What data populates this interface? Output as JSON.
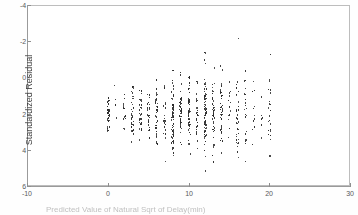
{
  "figure": {
    "background_color": "#ffffff",
    "frame_color": "#bdbdbd",
    "point_color": "#2b2b2b"
  },
  "axes": {
    "y_title": "Standardized Residual",
    "x_title": "Predicted Value of Natural Sqrt of Delay(min)",
    "y_ticks": [
      "6",
      "4",
      "2",
      "0",
      "-2",
      "-4"
    ],
    "x_ticks": [
      "-10",
      "0",
      "10",
      "20",
      "30"
    ]
  },
  "chart_data": {
    "type": "scatter",
    "title": "",
    "xlabel": "Predicted Value of Natural Sqrt of Delay(min)",
    "ylabel": "Standardized Residual",
    "xlim": [
      -10,
      30
    ],
    "ylim": [
      -4,
      6
    ],
    "xticks": [
      -10,
      0,
      10,
      20,
      30
    ],
    "yticks": [
      -4,
      -2,
      0,
      2,
      4,
      6
    ],
    "grid": false,
    "legend": null,
    "series": [
      {
        "name": "residuals",
        "description": "Standardized residuals plotted against predicted values; points fall in near-vertical stripes at roughly integer predicted values from 0 to 20, with spread widening as the predicted value increases.",
        "columns": [
          {
            "x": 0.0,
            "y_min": -0.9,
            "y_max": 0.9,
            "n": 42,
            "y_center": 0.0,
            "spread": 0.45
          },
          {
            "x": 0.9,
            "y_min": -0.2,
            "y_max": 1.6,
            "n": 4,
            "y_center": 0.7,
            "spread": 0.6
          },
          {
            "x": 2.0,
            "y_min": -0.8,
            "y_max": 1.1,
            "n": 14,
            "y_center": 0.1,
            "spread": 0.5
          },
          {
            "x": 3.0,
            "y_min": -1.5,
            "y_max": 1.5,
            "n": 36,
            "y_center": 0.0,
            "spread": 0.7
          },
          {
            "x": 4.0,
            "y_min": -1.4,
            "y_max": 1.3,
            "n": 34,
            "y_center": 0.0,
            "spread": 0.65
          },
          {
            "x": 5.0,
            "y_min": -1.3,
            "y_max": 1.1,
            "n": 26,
            "y_center": -0.05,
            "spread": 0.6
          },
          {
            "x": 6.0,
            "y_min": -1.6,
            "y_max": 1.9,
            "n": 40,
            "y_center": 0.05,
            "spread": 0.8
          },
          {
            "x": 7.0,
            "y_min": -2.6,
            "y_max": 1.6,
            "n": 24,
            "y_center": -0.1,
            "spread": 0.85
          },
          {
            "x": 8.0,
            "y_min": -2.3,
            "y_max": 2.4,
            "n": 70,
            "y_center": 0.0,
            "spread": 0.95
          },
          {
            "x": 9.0,
            "y_min": -1.7,
            "y_max": 2.3,
            "n": 44,
            "y_center": 0.05,
            "spread": 0.85
          },
          {
            "x": 10.0,
            "y_min": -2.2,
            "y_max": 2.1,
            "n": 56,
            "y_center": 0.0,
            "spread": 0.9
          },
          {
            "x": 11.0,
            "y_min": -1.9,
            "y_max": 1.8,
            "n": 34,
            "y_center": 0.0,
            "spread": 0.85
          },
          {
            "x": 12.0,
            "y_min": -3.1,
            "y_max": 3.4,
            "n": 78,
            "y_center": 0.05,
            "spread": 1.1
          },
          {
            "x": 13.0,
            "y_min": -2.6,
            "y_max": 2.6,
            "n": 44,
            "y_center": 0.0,
            "spread": 1.0
          },
          {
            "x": 14.0,
            "y_min": -2.1,
            "y_max": 2.7,
            "n": 40,
            "y_center": 0.1,
            "spread": 1.0
          },
          {
            "x": 15.0,
            "y_min": -1.3,
            "y_max": 1.8,
            "n": 14,
            "y_center": 0.2,
            "spread": 0.8
          },
          {
            "x": 16.0,
            "y_min": -2.4,
            "y_max": 4.2,
            "n": 36,
            "y_center": 0.1,
            "spread": 1.2
          },
          {
            "x": 17.0,
            "y_min": -2.6,
            "y_max": 2.4,
            "n": 22,
            "y_center": 0.0,
            "spread": 1.1
          },
          {
            "x": 18.0,
            "y_min": -1.7,
            "y_max": 1.8,
            "n": 12,
            "y_center": 0.1,
            "spread": 0.9
          },
          {
            "x": 19.0,
            "y_min": -1.3,
            "y_max": 1.0,
            "n": 8,
            "y_center": -0.1,
            "spread": 0.6
          },
          {
            "x": 20.0,
            "y_min": -2.3,
            "y_max": 3.3,
            "n": 24,
            "y_center": 0.1,
            "spread": 1.2
          }
        ]
      }
    ]
  }
}
